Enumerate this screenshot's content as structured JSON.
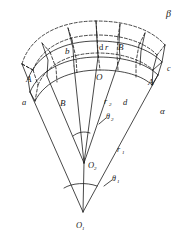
{
  "figure": {
    "type": "geometry-diagram",
    "stroke_color": "#1a1a1a",
    "background_color": "#ffffff"
  },
  "labels": {
    "beta": "β",
    "alpha": "α",
    "vertex_a": "a",
    "vertex_b": "b",
    "vertex_c": "c",
    "vertex_d": "d",
    "point_A_left": "A",
    "point_A_right": "A",
    "point_B_top": "B",
    "point_B_bottom": "B",
    "point_O": "O",
    "element_dr": "d",
    "element_dr_italic": "r",
    "radius_r1": "r",
    "radius_r1_sub": "1",
    "radius_r2": "r",
    "radius_r2_sub": "2",
    "angle_theta1": "θ",
    "angle_theta1_sub": "1",
    "angle_theta2": "θ",
    "angle_theta2_sub": "2",
    "apex_O1": "O",
    "apex_O1_sub": "1",
    "apex_O2": "O",
    "apex_O2_sub": "2"
  },
  "geometry": {
    "apex_O1": {
      "x": 83,
      "y": 212
    },
    "apex_O2": {
      "x": 84,
      "y": 163
    }
  }
}
